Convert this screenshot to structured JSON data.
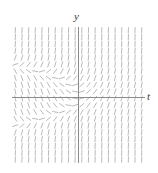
{
  "figure": {
    "width": 158,
    "height": 173,
    "background": "#ffffff",
    "axis_color": "#8a8a8a",
    "field_color": "#a8a8a8"
  },
  "labels": {
    "y_axis_label": "y",
    "t_axis_label": "t"
  },
  "chart_data": {
    "type": "scatter",
    "subtype": "slope-field",
    "title": "",
    "subtitle": "",
    "xlabel": "t",
    "ylabel": "y",
    "xlim": [
      -5,
      5
    ],
    "ylim": [
      -5,
      5
    ],
    "grid": false,
    "legend": null,
    "annotations": [],
    "tick_labels": {
      "x": [],
      "y": []
    },
    "axes": {
      "x_axis_pixel_y": 97,
      "y_axis_pixel_x": 78,
      "x_axis_pixel_range": [
        12,
        145
      ],
      "y_axis_pixel_range": [
        27,
        163
      ]
    },
    "field": {
      "description": "Direction field of dy/dt = y^2 + t rendered as short tangent segments on a uniform grid",
      "equation": "dy/dt = y^2 + t",
      "grid_columns": 20,
      "grid_rows": 20,
      "x_start": -5,
      "x_end": 5,
      "y_start": -5,
      "y_end": 5,
      "segment_length_px": 5.4,
      "stroke_width": 0.8,
      "stroke_color": "#a8a8a8"
    }
  }
}
